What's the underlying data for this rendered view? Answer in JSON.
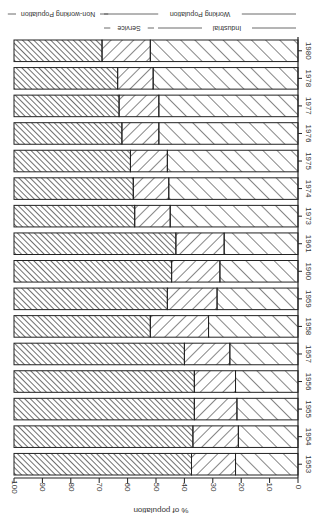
{
  "chart_data": {
    "type": "bar",
    "orientation": "horizontal-stacked",
    "rotation_degrees": 180,
    "title": "",
    "xlabel": "% of population",
    "ylabel": "",
    "xlim": [
      0,
      100
    ],
    "x_ticks": [
      0,
      10,
      20,
      30,
      40,
      50,
      60,
      70,
      80,
      90,
      100
    ],
    "grid": false,
    "categories": [
      "1953",
      "1954",
      "1955",
      "1956",
      "1957",
      "1958",
      "1959",
      "1960",
      "1961",
      "1973",
      "1974",
      "1975",
      "1976",
      "1977",
      "1978",
      "1980"
    ],
    "series": [
      {
        "name": "Industrial",
        "group": "Working Population",
        "hatch": "sparse-backslash",
        "values": [
          22,
          21,
          21.5,
          22,
          24,
          31.5,
          28.5,
          27.5,
          26,
          45,
          45.5,
          46,
          49,
          49,
          51,
          52
        ]
      },
      {
        "name": "Service",
        "group": "Working Population",
        "hatch": "forward-slash",
        "values": [
          15.5,
          16,
          15,
          14.5,
          16,
          20.5,
          17.5,
          17,
          17,
          12.5,
          12.5,
          13,
          13,
          14,
          12.5,
          17
        ]
      },
      {
        "name": "Non-working Population",
        "group": "Non-working Population",
        "hatch": "dense-backslash",
        "values": [
          62.5,
          63,
          63.5,
          63.5,
          60,
          48,
          54,
          55.5,
          57,
          42.5,
          42,
          41,
          38,
          37,
          36.5,
          31
        ]
      }
    ],
    "cumulative_boundaries": {
      "industrial_end": [
        22,
        21,
        21.5,
        22,
        24,
        31.5,
        28.5,
        27.5,
        26,
        45,
        45.5,
        46,
        49,
        49,
        51,
        52
      ],
      "service_end": [
        37.5,
        37,
        36.5,
        36.5,
        40,
        52,
        46,
        44.5,
        43,
        57.5,
        58,
        59,
        62,
        63,
        63.5,
        69
      ]
    },
    "legend": {
      "position": "top",
      "entries": [
        "Non-working Population",
        "Working Population",
        "Service",
        "Industrial"
      ]
    }
  },
  "labels": {
    "xlabel": "% of population",
    "non_working": "Non-working Population",
    "working": "Working Population",
    "service": "Service",
    "industrial": "Industrial"
  }
}
